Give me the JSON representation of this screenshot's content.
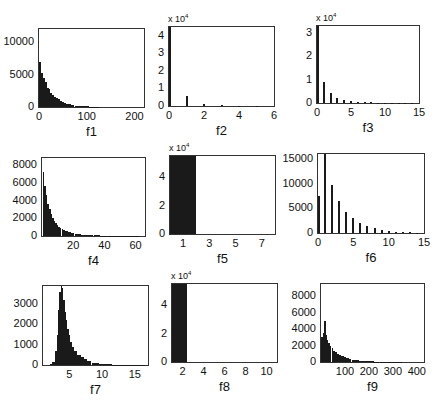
{
  "figure": {
    "layout": "3x3 grid of histograms",
    "bar_color": "#1a1a1a",
    "axes_border_color": "#333333"
  },
  "chart_data": [
    {
      "id": "f1",
      "type": "bar",
      "xlabel": "f1",
      "ylabel": "",
      "xlim": [
        0,
        220
      ],
      "ylim": [
        0,
        12000
      ],
      "xticks": [
        "0",
        "100",
        "200"
      ],
      "yticks": [
        "0",
        "5000",
        "10000"
      ],
      "y_multiplier": "",
      "x": [
        2,
        6,
        10,
        14,
        18,
        22,
        26,
        30,
        34,
        38,
        42,
        46,
        50,
        55,
        60,
        65,
        70,
        80,
        90,
        100,
        110,
        120
      ],
      "values": [
        7000,
        5300,
        4500,
        3900,
        3000,
        2700,
        2200,
        1900,
        1600,
        1400,
        1200,
        950,
        800,
        650,
        500,
        400,
        300,
        200,
        150,
        100,
        60,
        30
      ],
      "box": {
        "left": 38,
        "top": 28,
        "width": 107,
        "height": 80
      }
    },
    {
      "id": "f2",
      "type": "bar",
      "xlabel": "f2",
      "ylabel": "",
      "xlim": [
        0,
        6
      ],
      "ylim": [
        0,
        45000
      ],
      "xticks": [
        "0",
        "2",
        "4",
        "6"
      ],
      "yticks": [
        "0",
        "1",
        "2",
        "3",
        "4"
      ],
      "y_multiplier": "x 10^4",
      "x": [
        0,
        1,
        2,
        3,
        4,
        5
      ],
      "values": [
        45000,
        5500,
        1200,
        500,
        200,
        100
      ],
      "box": {
        "left": 168,
        "top": 26,
        "width": 107,
        "height": 81
      }
    },
    {
      "id": "f3",
      "type": "bar",
      "xlabel": "f3",
      "ylabel": "",
      "xlim": [
        0,
        15
      ],
      "ylim": [
        0,
        33000
      ],
      "xticks": [
        "0",
        "5",
        "10",
        "15"
      ],
      "yticks": [
        "0",
        "1",
        "2",
        "3"
      ],
      "y_multiplier": "x 10^4",
      "x": [
        0,
        1,
        2,
        3,
        4,
        5,
        6,
        7,
        8,
        9,
        10,
        11,
        12,
        13,
        14
      ],
      "values": [
        33000,
        9000,
        4500,
        2300,
        1400,
        900,
        600,
        400,
        300,
        200,
        150,
        120,
        90,
        60,
        40
      ],
      "box": {
        "left": 316,
        "top": 25,
        "width": 104,
        "height": 79
      }
    },
    {
      "id": "f4",
      "type": "bar",
      "xlabel": "f4",
      "ylabel": "",
      "xlim": [
        0,
        66
      ],
      "ylim": [
        0,
        8800
      ],
      "xticks": [
        "20",
        "40",
        "60"
      ],
      "yticks": [
        "0",
        "2000",
        "4000",
        "6000",
        "8000"
      ],
      "y_multiplier": "",
      "x": [
        1,
        2,
        3,
        4,
        5,
        6,
        7,
        8,
        9,
        10,
        11,
        12,
        13,
        14,
        15,
        16,
        17,
        18,
        19,
        20,
        22,
        24,
        26,
        28,
        30,
        32,
        34,
        36,
        38,
        40,
        44,
        48,
        52,
        56,
        60,
        64
      ],
      "values": [
        7200,
        5600,
        4600,
        3600,
        3000,
        2500,
        2050,
        1750,
        1450,
        1200,
        1050,
        900,
        780,
        680,
        600,
        520,
        450,
        400,
        350,
        300,
        240,
        200,
        160,
        130,
        110,
        90,
        75,
        60,
        50,
        40,
        30,
        25,
        20,
        15,
        10,
        8
      ],
      "box": {
        "left": 41,
        "top": 157,
        "width": 105,
        "height": 80
      }
    },
    {
      "id": "f5",
      "type": "bar",
      "xlabel": "f5",
      "ylabel": "",
      "xlim": [
        0,
        8
      ],
      "ylim": [
        0,
        55000
      ],
      "xticks": [
        "1",
        "3",
        "5",
        "7"
      ],
      "yticks": [
        "0",
        "2",
        "4"
      ],
      "y_multiplier": "x 10^4",
      "x": [
        1
      ],
      "values": [
        55000
      ],
      "bin_span": [
        0,
        2
      ],
      "box": {
        "left": 169,
        "top": 155,
        "width": 107,
        "height": 80
      }
    },
    {
      "id": "f6",
      "type": "bar",
      "xlabel": "f6",
      "ylabel": "",
      "xlim": [
        0,
        15
      ],
      "ylim": [
        0,
        16000
      ],
      "xticks": [
        "0",
        "5",
        "10",
        "15"
      ],
      "yticks": [
        "0",
        "5000",
        "10000",
        "15000"
      ],
      "y_multiplier": "",
      "x": [
        0,
        1,
        2,
        3,
        4,
        5,
        6,
        7,
        8,
        9,
        10,
        11,
        12,
        13,
        14
      ],
      "values": [
        7500,
        16000,
        9800,
        6500,
        4200,
        3000,
        2100,
        1400,
        1000,
        700,
        400,
        300,
        200,
        120,
        80
      ],
      "box": {
        "left": 317,
        "top": 153,
        "width": 108,
        "height": 81
      }
    },
    {
      "id": "f7",
      "type": "bar",
      "xlabel": "f7",
      "ylabel": "",
      "xlim": [
        1,
        17
      ],
      "ylim": [
        0,
        3900
      ],
      "xticks": [
        "5",
        "10",
        "15"
      ],
      "yticks": [
        "0",
        "1000",
        "2000",
        "3000"
      ],
      "y_multiplier": "",
      "x": [
        2.2,
        2.6,
        3.0,
        3.2,
        3.4,
        3.6,
        3.8,
        4.0,
        4.2,
        4.4,
        4.6,
        4.8,
        5.0,
        5.3,
        5.6,
        6.0,
        6.5,
        7.0,
        7.5,
        8,
        9,
        10,
        11,
        12,
        13,
        14,
        15,
        16
      ],
      "values": [
        30,
        150,
        700,
        1500,
        2700,
        3600,
        3900,
        3800,
        3200,
        2600,
        2200,
        1800,
        1500,
        1150,
        900,
        700,
        500,
        380,
        280,
        200,
        120,
        70,
        40,
        25,
        15,
        10,
        6,
        4
      ],
      "box": {
        "left": 42,
        "top": 285,
        "width": 107,
        "height": 81
      }
    },
    {
      "id": "f8",
      "type": "bar",
      "xlabel": "f8",
      "ylabel": "",
      "xlim": [
        1,
        11
      ],
      "ylim": [
        0,
        55000
      ],
      "xticks": [
        "2",
        "4",
        "6",
        "8",
        "10"
      ],
      "yticks": [
        "0",
        "2",
        "4"
      ],
      "y_multiplier": "x 10^4",
      "x": [
        1.7
      ],
      "values": [
        55000
      ],
      "bin_span": [
        1.0,
        2.4
      ],
      "box": {
        "left": 171,
        "top": 283,
        "width": 107,
        "height": 80
      }
    },
    {
      "id": "f9",
      "type": "bar",
      "xlabel": "f9",
      "ylabel": "",
      "xlim": [
        0,
        430
      ],
      "ylim": [
        0,
        9500
      ],
      "xticks": [
        "100",
        "200",
        "300",
        "400"
      ],
      "yticks": [
        "0",
        "2000",
        "4000",
        "6000",
        "8000"
      ],
      "y_multiplier": "",
      "x": [
        4,
        10,
        16,
        22,
        28,
        34,
        40,
        48,
        56,
        64,
        72,
        80,
        90,
        100,
        110,
        120,
        135,
        150,
        170,
        190,
        210,
        230,
        260,
        290,
        320,
        360,
        400
      ],
      "values": [
        3000,
        3500,
        5000,
        3300,
        2700,
        2300,
        2000,
        1700,
        1400,
        1200,
        1000,
        850,
        700,
        550,
        450,
        380,
        300,
        230,
        170,
        120,
        90,
        60,
        40,
        25,
        15,
        8,
        4
      ],
      "box": {
        "left": 320,
        "top": 283,
        "width": 105,
        "height": 80
      }
    }
  ]
}
